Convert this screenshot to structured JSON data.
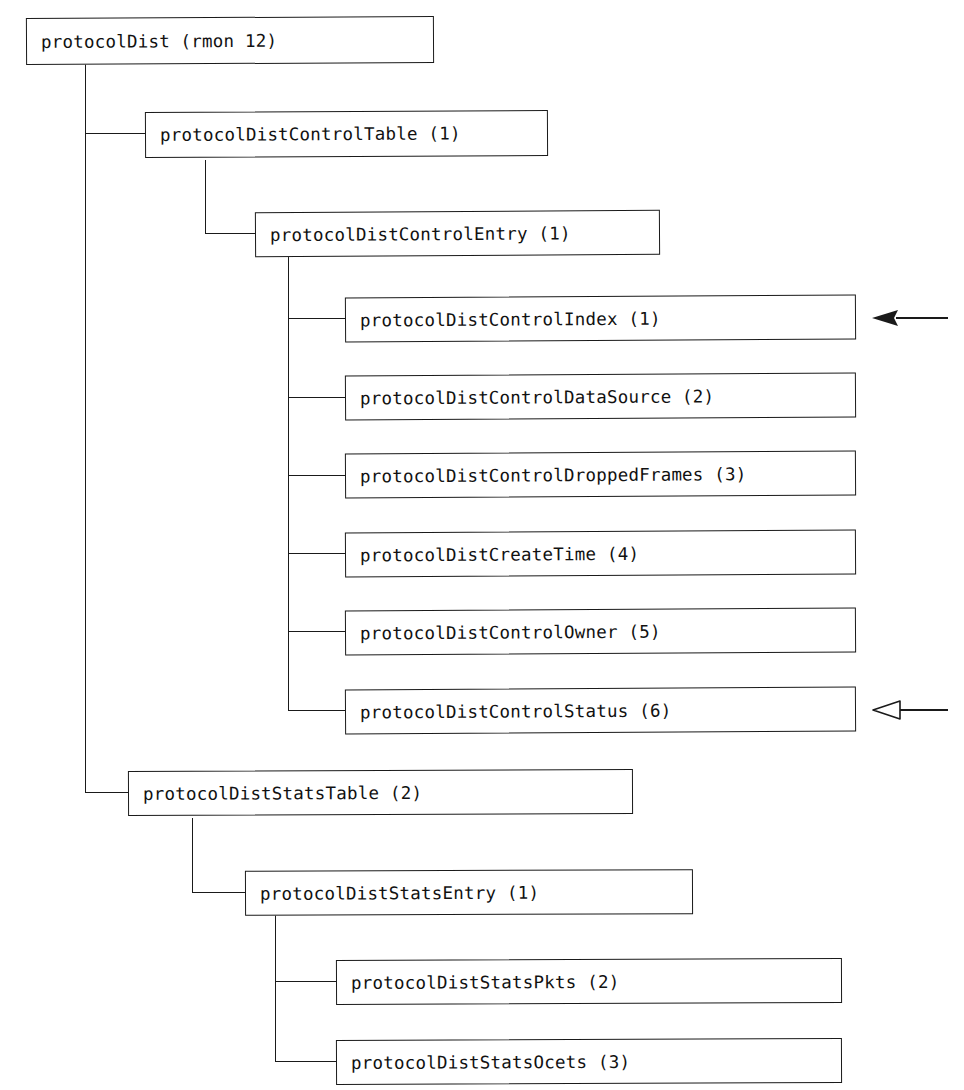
{
  "diagram": {
    "title": "protocolDist (rmon 12)",
    "type": "mib-object-tree",
    "nodes": [
      {
        "id": "root",
        "label": "protocolDist (rmon 12)"
      },
      {
        "id": "ctrl_table",
        "label": "protocolDistControlTable (1)"
      },
      {
        "id": "ctrl_entry",
        "label": "protocolDistControlEntry (1)"
      },
      {
        "id": "ctrl_index",
        "label": "protocolDistControlIndex (1)"
      },
      {
        "id": "ctrl_datasrc",
        "label": "protocolDistControlDataSource (2)"
      },
      {
        "id": "ctrl_dropped",
        "label": "protocolDistControlDroppedFrames (3)"
      },
      {
        "id": "create_time",
        "label": "protocolDistCreateTime (4)"
      },
      {
        "id": "ctrl_owner",
        "label": "protocolDistControlOwner (5)"
      },
      {
        "id": "ctrl_status",
        "label": "protocolDistControlStatus (6)"
      },
      {
        "id": "stats_table",
        "label": "protocolDistStatsTable (2)"
      },
      {
        "id": "stats_entry",
        "label": "protocolDistStatsEntry (1)"
      },
      {
        "id": "stats_pkts",
        "label": "protocolDistStatsPkts (2)"
      },
      {
        "id": "stats_ocets",
        "label": "protocolDistStatsOcets (3)"
      }
    ],
    "annotations": [
      {
        "id": "arrow_index",
        "style": "solid",
        "direction": "left",
        "points_at": "protocolDistControlIndex (1)"
      },
      {
        "id": "arrow_status",
        "style": "hollow",
        "direction": "left",
        "points_at": "protocolDistControlStatus (6)"
      }
    ],
    "colors": {
      "line": "#1a1a1a",
      "box_fill": "#ffffff",
      "text": "#111111",
      "background": "#ffffff"
    }
  }
}
